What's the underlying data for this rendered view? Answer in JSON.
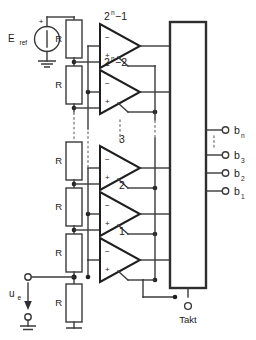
{
  "diagram": {
    "reference_source": {
      "label": "E",
      "label_sub": "ref",
      "polarity": "+",
      "symbol": "voltage-source-circle",
      "ground": "ground-symbol"
    },
    "input": {
      "label": "u",
      "label_sub": "e",
      "arrow": "down-arrow",
      "top_terminal": "open-circle",
      "bottom_terminal": "open-circle",
      "ground": "ground-symbol"
    },
    "resistors": [
      {
        "label": "R"
      },
      {
        "label": "R"
      },
      {
        "label": "R"
      },
      {
        "label": "R"
      },
      {
        "label": "R"
      },
      {
        "label": "R"
      }
    ],
    "comparators": [
      {
        "label": "2",
        "exponent": "n",
        "suffix": "−1",
        "minus": "−",
        "plus": "+"
      },
      {
        "label": "2",
        "exponent": "n",
        "suffix": "−2",
        "minus": "−",
        "plus": "+"
      },
      {
        "label": "3",
        "exponent": "",
        "suffix": "",
        "minus": "−",
        "plus": "+"
      },
      {
        "label": "2",
        "exponent": "",
        "suffix": "",
        "minus": "−",
        "plus": "+"
      },
      {
        "label": "1",
        "exponent": "",
        "suffix": "",
        "minus": "−",
        "plus": "+"
      }
    ],
    "encoder": {
      "name": "encoder-block",
      "label": ""
    },
    "outputs": [
      {
        "label": "b",
        "sub": "n",
        "terminal": "open-circle"
      },
      {
        "label": "b",
        "sub": "3",
        "terminal": "open-circle"
      },
      {
        "label": "b",
        "sub": "2",
        "terminal": "open-circle"
      },
      {
        "label": "b",
        "sub": "1",
        "terminal": "open-circle"
      }
    ],
    "clock": {
      "label": "Takt",
      "terminal": "open-circle"
    },
    "ellipsis": {
      "glyph": "⋮",
      "count": 3
    },
    "colors": {
      "wire": "#3a3a3a",
      "box": "#2e2e2e",
      "text": "#1b1b1b",
      "dotted": "#8a8a8a",
      "background": "#ffffff"
    }
  }
}
